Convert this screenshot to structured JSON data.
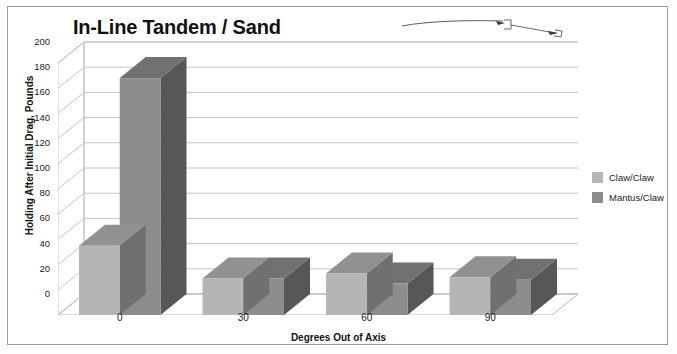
{
  "title": "In-Line Tandem / Sand",
  "axis": {
    "y_title": "Holding After Initial Drag, Pounds",
    "x_title": "Degrees Out of Axis"
  },
  "legend": {
    "items": [
      {
        "label": "Claw/Claw",
        "color": "#b5b5b5"
      },
      {
        "label": "Mantus/Claw",
        "color": "#8d8d8d"
      }
    ]
  },
  "chart_data": {
    "type": "bar",
    "title": "In-Line Tandem / Sand",
    "xlabel": "Degrees Out of Axis",
    "ylabel": "Holding After Initial Drag, Pounds",
    "categories": [
      "0",
      "30",
      "60",
      "90"
    ],
    "series": [
      {
        "name": "Claw/Claw",
        "color": "#b5b5b5",
        "values": [
          55,
          29,
          33,
          30
        ]
      },
      {
        "name": "Mantus/Claw",
        "color": "#8d8d8d",
        "values": [
          188,
          29,
          25,
          28
        ]
      }
    ],
    "ylim": [
      0,
      200
    ],
    "yticks": [
      0,
      20,
      40,
      60,
      80,
      100,
      120,
      140,
      160,
      180,
      200
    ],
    "ytick_labels": [
      "0",
      "20",
      "40",
      "60",
      "80",
      "100",
      "120",
      "140",
      "160",
      "180",
      "200"
    ],
    "grid": true,
    "legend_position": "right",
    "three_d": true
  },
  "artifact": {
    "name": "scan-stray-mark"
  }
}
